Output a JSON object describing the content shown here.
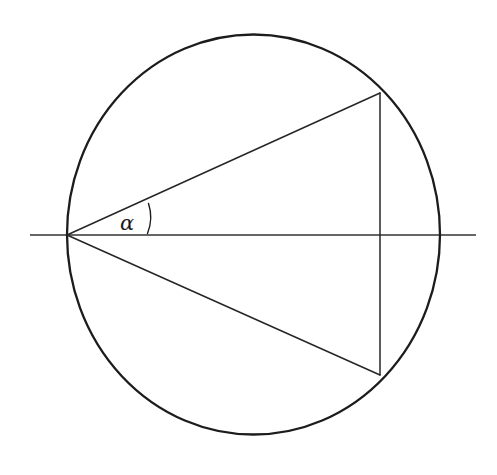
{
  "figure": {
    "name": "inscribed-angle-circle-diagram",
    "canvas": {
      "width": 497,
      "height": 475,
      "background": "#ffffff"
    },
    "stroke_colors": {
      "circle": "#1c1c1c",
      "chord": "#262626",
      "axis": "#333333",
      "arc_marker": "#1c1c1c"
    },
    "stroke_widths": {
      "circle": 2.3,
      "chord": 1.5,
      "axis": 1.6,
      "arc_marker": 1.4
    }
  },
  "circle": {
    "center_x": 253.5,
    "center_y": 234.5,
    "radius_x": 186.5,
    "radius_y": 200.0
  },
  "axis_line": {
    "label": "horizontal-diameter",
    "x1": 30,
    "y1": 235,
    "x2": 476,
    "y2": 235
  },
  "points": {
    "apex": {
      "label": "apex-vertex-left",
      "x": 67,
      "y": 235
    },
    "upper_right": {
      "label": "upper-right-vertex",
      "x": 380,
      "y": 93
    },
    "lower_right": {
      "label": "lower-right-vertex",
      "x": 380,
      "y": 375
    },
    "right_extreme": {
      "label": "rightmost-circle-point",
      "x": 440,
      "y": 235
    }
  },
  "segments": [
    {
      "name": "chord-apex-to-upper-right",
      "x1": 67,
      "y1": 235,
      "x2": 380,
      "y2": 93
    },
    {
      "name": "chord-apex-to-lower-right",
      "x1": 67,
      "y1": 235,
      "x2": 380,
      "y2": 375
    },
    {
      "name": "vertical-chord-right",
      "x1": 380,
      "y1": 93,
      "x2": 380,
      "y2": 375
    }
  ],
  "angle_marker": {
    "name": "alpha-angle-arc",
    "path": "M 148.5 203.5 Q 153.5 218.5 147.5 233.5",
    "vertex_x": 67,
    "vertex_y": 235
  },
  "labels": {
    "alpha": {
      "text": "α",
      "x": 120,
      "y": 230,
      "font_size": 21,
      "color": "#1c1c1c"
    }
  }
}
